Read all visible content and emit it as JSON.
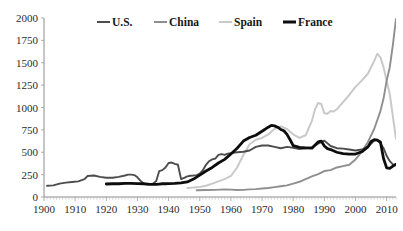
{
  "chart_data": {
    "type": "line",
    "title": "",
    "subtitle": "",
    "xlabel": "",
    "ylabel": "",
    "xlim": [
      1900,
      2013
    ],
    "ylim": [
      0,
      2000
    ],
    "ytick_step": 250,
    "xtick_step": 10,
    "grid": false,
    "legend_position": "top-center",
    "yticks": [
      "2000",
      "1750",
      "1500",
      "1250",
      "1000",
      "750",
      "500",
      "250",
      "0"
    ],
    "xticks": [
      "1900",
      "1910",
      "1920",
      "1930",
      "1940",
      "1950",
      "1960",
      "1970",
      "1980",
      "1990",
      "2000",
      "2010"
    ],
    "legend": [
      {
        "name": "U.S.",
        "color": "#4d4d4d"
      },
      {
        "name": "China",
        "color": "#8f8f8f"
      },
      {
        "name": "Spain",
        "color": "#c9c9c9"
      },
      {
        "name": "France",
        "color": "#0d0d0d"
      }
    ],
    "series": [
      {
        "name": "U.S.",
        "color": "#4d4d4d",
        "width": 1.9,
        "x": [
          1901,
          1903,
          1905,
          1907,
          1909,
          1911,
          1913,
          1914,
          1916,
          1918,
          1920,
          1922,
          1924,
          1926,
          1927,
          1928,
          1929,
          1930,
          1931,
          1932,
          1933,
          1934,
          1935,
          1936,
          1937,
          1938,
          1939,
          1940,
          1941,
          1942,
          1943,
          1944,
          1945,
          1946,
          1947,
          1948,
          1949,
          1950,
          1951,
          1952,
          1953,
          1954,
          1955,
          1956,
          1957,
          1958,
          1959,
          1960,
          1962,
          1964,
          1966,
          1968,
          1970,
          1972,
          1974,
          1976,
          1978,
          1980,
          1982,
          1984,
          1986,
          1988,
          1990,
          1992,
          1994,
          1996,
          1998,
          2000,
          2002,
          2004,
          2006,
          2007,
          2008,
          2009,
          2010,
          2011,
          2012,
          2013
        ],
        "values": [
          125,
          130,
          150,
          160,
          168,
          175,
          200,
          235,
          240,
          225,
          215,
          215,
          225,
          240,
          250,
          250,
          245,
          220,
          180,
          150,
          142,
          145,
          150,
          175,
          290,
          300,
          330,
          380,
          385,
          370,
          360,
          200,
          215,
          230,
          238,
          240,
          245,
          260,
          300,
          360,
          400,
          420,
          430,
          470,
          480,
          470,
          485,
          490,
          500,
          505,
          520,
          560,
          575,
          575,
          560,
          545,
          560,
          550,
          535,
          545,
          555,
          595,
          630,
          570,
          545,
          540,
          530,
          520,
          530,
          560,
          630,
          640,
          600,
          545,
          460,
          400,
          365,
          360
        ]
      },
      {
        "name": "China",
        "color": "#8f8f8f",
        "width": 1.9,
        "x": [
          1949,
          1952,
          1955,
          1958,
          1960,
          1962,
          1964,
          1966,
          1968,
          1970,
          1972,
          1974,
          1976,
          1978,
          1980,
          1982,
          1984,
          1986,
          1988,
          1990,
          1992,
          1994,
          1996,
          1998,
          2000,
          2002,
          2004,
          2006,
          2008,
          2009,
          2010,
          2011,
          2012,
          2013
        ],
        "values": [
          75,
          78,
          80,
          85,
          82,
          78,
          80,
          85,
          88,
          95,
          100,
          110,
          120,
          130,
          150,
          170,
          200,
          230,
          255,
          290,
          300,
          330,
          345,
          360,
          420,
          505,
          615,
          760,
          960,
          1100,
          1300,
          1450,
          1700,
          1990
        ]
      },
      {
        "name": "Spain",
        "color": "#c9c9c9",
        "width": 2.0,
        "x": [
          1946,
          1948,
          1950,
          1952,
          1954,
          1956,
          1958,
          1960,
          1962,
          1964,
          1966,
          1968,
          1970,
          1972,
          1974,
          1976,
          1978,
          1980,
          1982,
          1984,
          1986,
          1987,
          1988,
          1989,
          1990,
          1991,
          1992,
          1993,
          1994,
          1996,
          1998,
          2000,
          2002,
          2004,
          2006,
          2007,
          2008,
          2009,
          2010,
          2011,
          2012,
          2013
        ],
        "values": [
          100,
          105,
          112,
          125,
          150,
          175,
          200,
          235,
          330,
          470,
          590,
          640,
          660,
          700,
          760,
          790,
          760,
          700,
          660,
          690,
          850,
          980,
          1050,
          1040,
          935,
          930,
          960,
          955,
          980,
          1060,
          1140,
          1230,
          1300,
          1380,
          1520,
          1600,
          1560,
          1450,
          1300,
          1150,
          900,
          650
        ]
      },
      {
        "name": "France",
        "color": "#0d0d0d",
        "width": 2.8,
        "x": [
          1920,
          1922,
          1924,
          1926,
          1928,
          1930,
          1932,
          1934,
          1935,
          1936,
          1937,
          1938,
          1939,
          1940,
          1942,
          1944,
          1946,
          1948,
          1950,
          1952,
          1954,
          1956,
          1958,
          1960,
          1962,
          1964,
          1966,
          1968,
          1970,
          1972,
          1973,
          1974,
          1975,
          1976,
          1977,
          1978,
          1979,
          1980,
          1982,
          1984,
          1986,
          1988,
          1989,
          1990,
          1991,
          1992,
          1994,
          1996,
          1998,
          2000,
          2002,
          2004,
          2005,
          2006,
          2007,
          2008,
          2009,
          2010,
          2011,
          2012,
          2013
        ],
        "values": [
          145,
          148,
          148,
          152,
          152,
          150,
          148,
          142,
          140,
          142,
          145,
          148,
          148,
          150,
          152,
          158,
          168,
          200,
          245,
          290,
          330,
          380,
          420,
          480,
          545,
          625,
          665,
          690,
          735,
          780,
          800,
          795,
          780,
          755,
          740,
          700,
          640,
          575,
          555,
          550,
          545,
          615,
          625,
          570,
          540,
          530,
          500,
          485,
          480,
          480,
          505,
          560,
          620,
          640,
          635,
          615,
          430,
          325,
          320,
          345,
          365
        ]
      }
    ]
  }
}
